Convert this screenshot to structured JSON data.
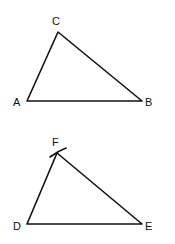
{
  "diagram": {
    "triangles": [
      {
        "name": "ABC",
        "vertices": {
          "A": {
            "label": "A",
            "x": 27,
            "y": 101
          },
          "B": {
            "label": "B",
            "x": 142,
            "y": 101
          },
          "C": {
            "label": "C",
            "x": 58,
            "y": 32
          }
        }
      },
      {
        "name": "DEF",
        "vertices": {
          "D": {
            "label": "D",
            "x": 27,
            "y": 224
          },
          "E": {
            "label": "E",
            "x": 142,
            "y": 224
          },
          "F": {
            "label": "F",
            "x": 57,
            "y": 153
          }
        },
        "construction_mark": "arc crossing at F"
      }
    ],
    "colors": {
      "stroke": "#111111",
      "background": "#ffffff"
    }
  }
}
